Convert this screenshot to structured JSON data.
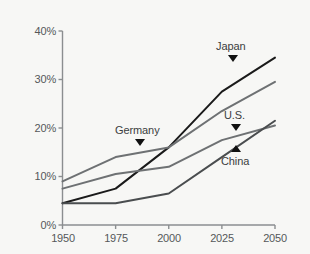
{
  "chart_data": {
    "type": "line",
    "title": "",
    "subtitle": "",
    "xlabel": "",
    "ylabel": "",
    "x": [
      1950,
      1975,
      2000,
      2025,
      2050
    ],
    "xtick_labels": [
      "1950",
      "1975",
      "2000",
      "2025",
      "2050"
    ],
    "ytick_labels": [
      "0%",
      "10%",
      "20%",
      "30%",
      "40%"
    ],
    "ytick_values": [
      0,
      10,
      20,
      30,
      40
    ],
    "xlim": [
      1950,
      2050
    ],
    "ylim": [
      0,
      40
    ],
    "grid": false,
    "legend_position": "inline-annotations",
    "series": [
      {
        "name": "Japan",
        "color": "#1a1a1a",
        "values": [
          4.5,
          7.5,
          16.0,
          27.5,
          34.5
        ]
      },
      {
        "name": "Germany",
        "color": "#6e7173",
        "values": [
          9.0,
          14.0,
          16.0,
          23.5,
          29.5
        ]
      },
      {
        "name": "U.S.",
        "color": "#6e7173",
        "values": [
          7.5,
          10.5,
          12.0,
          17.5,
          20.5
        ]
      },
      {
        "name": "China",
        "color": "#4a4d4f",
        "values": [
          4.5,
          4.5,
          6.5,
          14.0,
          21.5
        ]
      }
    ],
    "annotations": [
      {
        "text": "Japan",
        "marker": "down-triangle",
        "target_series": "Japan"
      },
      {
        "text": "Germany",
        "marker": "down-triangle",
        "target_series": "Germany"
      },
      {
        "text": "U.S.",
        "marker": "down-triangle",
        "target_series": "U.S."
      },
      {
        "text": "China",
        "marker": "up-triangle",
        "target_series": "China"
      }
    ]
  },
  "axes": {
    "y_ticks": [
      {
        "label": "40%"
      },
      {
        "label": "30%"
      },
      {
        "label": "20%"
      },
      {
        "label": "10%"
      },
      {
        "label": "0%"
      }
    ],
    "x_ticks": [
      {
        "label": "1950"
      },
      {
        "label": "1975"
      },
      {
        "label": "2000"
      },
      {
        "label": "2025"
      },
      {
        "label": "2050"
      }
    ],
    "axis_color": "#8b8e90"
  },
  "labels": {
    "japan": "Japan",
    "germany": "Germany",
    "us": "U.S.",
    "china": "China"
  },
  "colors": {
    "background": "#f7f7f5",
    "dark_line": "#1a1a1a",
    "gray_line": "#6e7173",
    "text": "#55585a",
    "marker": "#111111"
  }
}
